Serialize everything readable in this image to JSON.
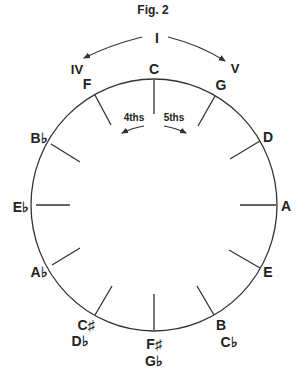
{
  "figure": {
    "title": "Fig. 2",
    "roman": {
      "tonic": "I",
      "subdominant": "IV",
      "dominant": "V"
    },
    "direction_labels": {
      "fourths": "4ths",
      "fifths": "5ths"
    },
    "keys": [
      {
        "name": "C"
      },
      {
        "name": "G"
      },
      {
        "name": "D"
      },
      {
        "name": "A"
      },
      {
        "name": "E"
      },
      {
        "name": "B",
        "alt": "C♭"
      },
      {
        "name": "F♯",
        "alt": "G♭"
      },
      {
        "name": "C♯",
        "alt": "D♭"
      },
      {
        "name": "A♭"
      },
      {
        "name": "E♭"
      },
      {
        "name": "B♭"
      },
      {
        "name": "F"
      }
    ],
    "colors": {
      "line": "#333333",
      "text": "#222222",
      "background": "#ffffff"
    }
  }
}
